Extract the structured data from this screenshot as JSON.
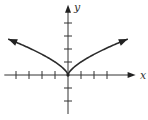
{
  "chart_data": {
    "type": "line",
    "title": "",
    "xlabel": "x",
    "ylabel": "y",
    "xlim": [
      -4.9,
      5.2
    ],
    "ylim": [
      -3,
      5.4
    ],
    "x_ticks": [
      -4,
      -3,
      -2,
      -1,
      1,
      2,
      3
    ],
    "y_ticks": [
      -2,
      -1,
      1,
      2,
      3,
      4
    ],
    "grid": false,
    "tick_labels_shown": false,
    "series": [
      {
        "name": "y = x^(2/3)",
        "function": "x^(2/3)",
        "domain": [
          -4.6,
          4.6
        ],
        "arrows_both_ends": true,
        "points": [
          {
            "x": -4.6,
            "y": 2.77
          },
          {
            "x": -3,
            "y": 2.08
          },
          {
            "x": -2,
            "y": 1.59
          },
          {
            "x": -1,
            "y": 1.0
          },
          {
            "x": 0,
            "y": 0
          },
          {
            "x": 1,
            "y": 1.0
          },
          {
            "x": 2,
            "y": 1.59
          },
          {
            "x": 3,
            "y": 2.08
          },
          {
            "x": 4.6,
            "y": 2.77
          }
        ]
      }
    ]
  }
}
